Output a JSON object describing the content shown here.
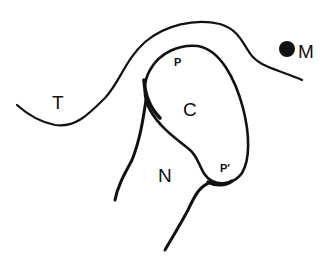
{
  "diagram": {
    "labels": {
      "T": "T",
      "M": "M",
      "C": "C",
      "N": "N",
      "P": "P",
      "P_prime": "P'"
    },
    "colors": {
      "stroke": "#111111",
      "background": "#ffffff"
    }
  }
}
